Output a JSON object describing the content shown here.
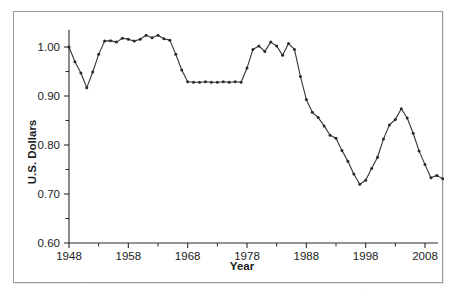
{
  "figure": {
    "background_color": "#ffffff",
    "frame_color": "#9a9a9a",
    "line_color": "#333333"
  },
  "chart_data": {
    "type": "line",
    "title": "",
    "subtitle": "",
    "xlabel": "Year",
    "ylabel": "U.S. Dollars",
    "xlim": [
      1947,
      2010
    ],
    "ylim": [
      0.6,
      1.035
    ],
    "xticks": [
      1948,
      1958,
      1968,
      1978,
      1988,
      1998,
      2008
    ],
    "xtick_labels": [
      "1948",
      "1958",
      "1968",
      "1978",
      "1988",
      "1998",
      "2008"
    ],
    "x_minor_ticks": [
      1953,
      1963,
      1973,
      1983,
      1993,
      2003
    ],
    "yticks": [
      0.6,
      0.7,
      0.8,
      0.9,
      1.0
    ],
    "ytick_labels": [
      "0.60",
      "0.70",
      "0.80",
      "0.90",
      "1.00"
    ],
    "y_minor_ticks": [
      0.65,
      0.75,
      0.85,
      0.95
    ],
    "grid": false,
    "legend": null,
    "markers": true,
    "series": [
      {
        "name": "U.S. Dollars",
        "x": [
          1948,
          1949,
          1950,
          1951,
          1952,
          1953,
          1954,
          1955,
          1956,
          1957,
          1958,
          1959,
          1960,
          1961,
          1962,
          1963,
          1964,
          1965,
          1966,
          1967,
          1968,
          1969,
          1970,
          1971,
          1972,
          1973,
          1974,
          1975,
          1976,
          1977,
          1978,
          1979,
          1980,
          1981,
          1982,
          1983,
          1984,
          1985,
          1986,
          1987,
          1988,
          1989,
          1990,
          1991,
          1992,
          1993,
          1994,
          1995,
          1996,
          1997,
          1998,
          1999,
          2000,
          2001,
          2002,
          2003,
          2004,
          2005,
          2006,
          2007,
          2008,
          2009
        ],
        "y": [
          1.0,
          0.97,
          0.947,
          0.917,
          0.949,
          0.985,
          1.012,
          1.013,
          1.01,
          1.018,
          1.016,
          1.012,
          1.016,
          1.018,
          1.024,
          1.019,
          1.024,
          1.017,
          1.014,
          0.985,
          0.953,
          0.929,
          0.928,
          0.928,
          0.929,
          0.928,
          0.928,
          0.929,
          0.928,
          0.929,
          0.928,
          0.957,
          0.995,
          1.002,
          0.991,
          1.01,
          1.002,
          0.983,
          1.007,
          0.995,
          0.94,
          0.893,
          0.867,
          0.856,
          0.839,
          0.82,
          0.814,
          0.789,
          0.767,
          0.741,
          0.72,
          0.728,
          0.752,
          0.775,
          0.812,
          0.841,
          0.852,
          0.874,
          0.855,
          0.824,
          0.788,
          0.76
        ],
        "x_extra": [
          2010,
          2011,
          2012,
          2013,
          2014,
          2015,
          2016,
          2017
        ],
        "y_extra": [
          0.733,
          0.738,
          0.731,
          0.722,
          0.676,
          0.675,
          0.675,
          0.637
        ]
      }
    ],
    "data_points": [
      {
        "year": 1948,
        "value": 1.0
      },
      {
        "year": 1949,
        "value": 0.97
      },
      {
        "year": 1950,
        "value": 0.947
      },
      {
        "year": 1951,
        "value": 0.917
      },
      {
        "year": 1952,
        "value": 0.949
      },
      {
        "year": 1953,
        "value": 0.985
      },
      {
        "year": 1954,
        "value": 1.012
      },
      {
        "year": 1955,
        "value": 1.013
      },
      {
        "year": 1956,
        "value": 1.01
      },
      {
        "year": 1957,
        "value": 1.018
      },
      {
        "year": 1958,
        "value": 1.016
      },
      {
        "year": 1959,
        "value": 1.012
      },
      {
        "year": 1960,
        "value": 1.016
      },
      {
        "year": 1961,
        "value": 1.024
      },
      {
        "year": 1962,
        "value": 1.019
      },
      {
        "year": 1963,
        "value": 1.024
      },
      {
        "year": 1964,
        "value": 1.017
      },
      {
        "year": 1965,
        "value": 1.014
      },
      {
        "year": 1966,
        "value": 0.985
      },
      {
        "year": 1967,
        "value": 0.953
      },
      {
        "year": 1968,
        "value": 0.929
      },
      {
        "year": 1969,
        "value": 0.928
      },
      {
        "year": 1970,
        "value": 0.928
      },
      {
        "year": 1971,
        "value": 0.929
      },
      {
        "year": 1972,
        "value": 0.928
      },
      {
        "year": 1973,
        "value": 0.928
      },
      {
        "year": 1974,
        "value": 0.929
      },
      {
        "year": 1975,
        "value": 0.928
      },
      {
        "year": 1976,
        "value": 0.929
      },
      {
        "year": 1977,
        "value": 0.928
      },
      {
        "year": 1978,
        "value": 0.957
      },
      {
        "year": 1979,
        "value": 0.995
      },
      {
        "year": 1980,
        "value": 1.002
      },
      {
        "year": 1981,
        "value": 0.991
      },
      {
        "year": 1982,
        "value": 1.01
      },
      {
        "year": 1983,
        "value": 1.002
      },
      {
        "year": 1984,
        "value": 0.983
      },
      {
        "year": 1985,
        "value": 1.007
      },
      {
        "year": 1986,
        "value": 0.995
      },
      {
        "year": 1987,
        "value": 0.94
      },
      {
        "year": 1988,
        "value": 0.893
      },
      {
        "year": 1989,
        "value": 0.867
      },
      {
        "year": 1990,
        "value": 0.856
      },
      {
        "year": 1991,
        "value": 0.839
      },
      {
        "year": 1992,
        "value": 0.82
      },
      {
        "year": 1993,
        "value": 0.814
      },
      {
        "year": 1994,
        "value": 0.789
      },
      {
        "year": 1995,
        "value": 0.767
      },
      {
        "year": 1996,
        "value": 0.741
      },
      {
        "year": 1997,
        "value": 0.72
      },
      {
        "year": 1998,
        "value": 0.728
      },
      {
        "year": 1999,
        "value": 0.752
      },
      {
        "year": 2000,
        "value": 0.775
      },
      {
        "year": 2001,
        "value": 0.812
      },
      {
        "year": 2002,
        "value": 0.841
      },
      {
        "year": 2003,
        "value": 0.852
      },
      {
        "year": 2004,
        "value": 0.874
      },
      {
        "year": 2005,
        "value": 0.855
      },
      {
        "year": 2006,
        "value": 0.824
      },
      {
        "year": 2007,
        "value": 0.788
      },
      {
        "year": 2008,
        "value": 0.76
      },
      {
        "year": 2009,
        "value": 0.733
      },
      {
        "year": 2010,
        "value": 0.738
      },
      {
        "year": 2011,
        "value": 0.731
      },
      {
        "year": 2012,
        "value": 0.722
      },
      {
        "year": 2013,
        "value": 0.676
      },
      {
        "year": 2014,
        "value": 0.675
      },
      {
        "year": 2015,
        "value": 0.675
      },
      {
        "year": 2016,
        "value": 0.637
      }
    ]
  }
}
